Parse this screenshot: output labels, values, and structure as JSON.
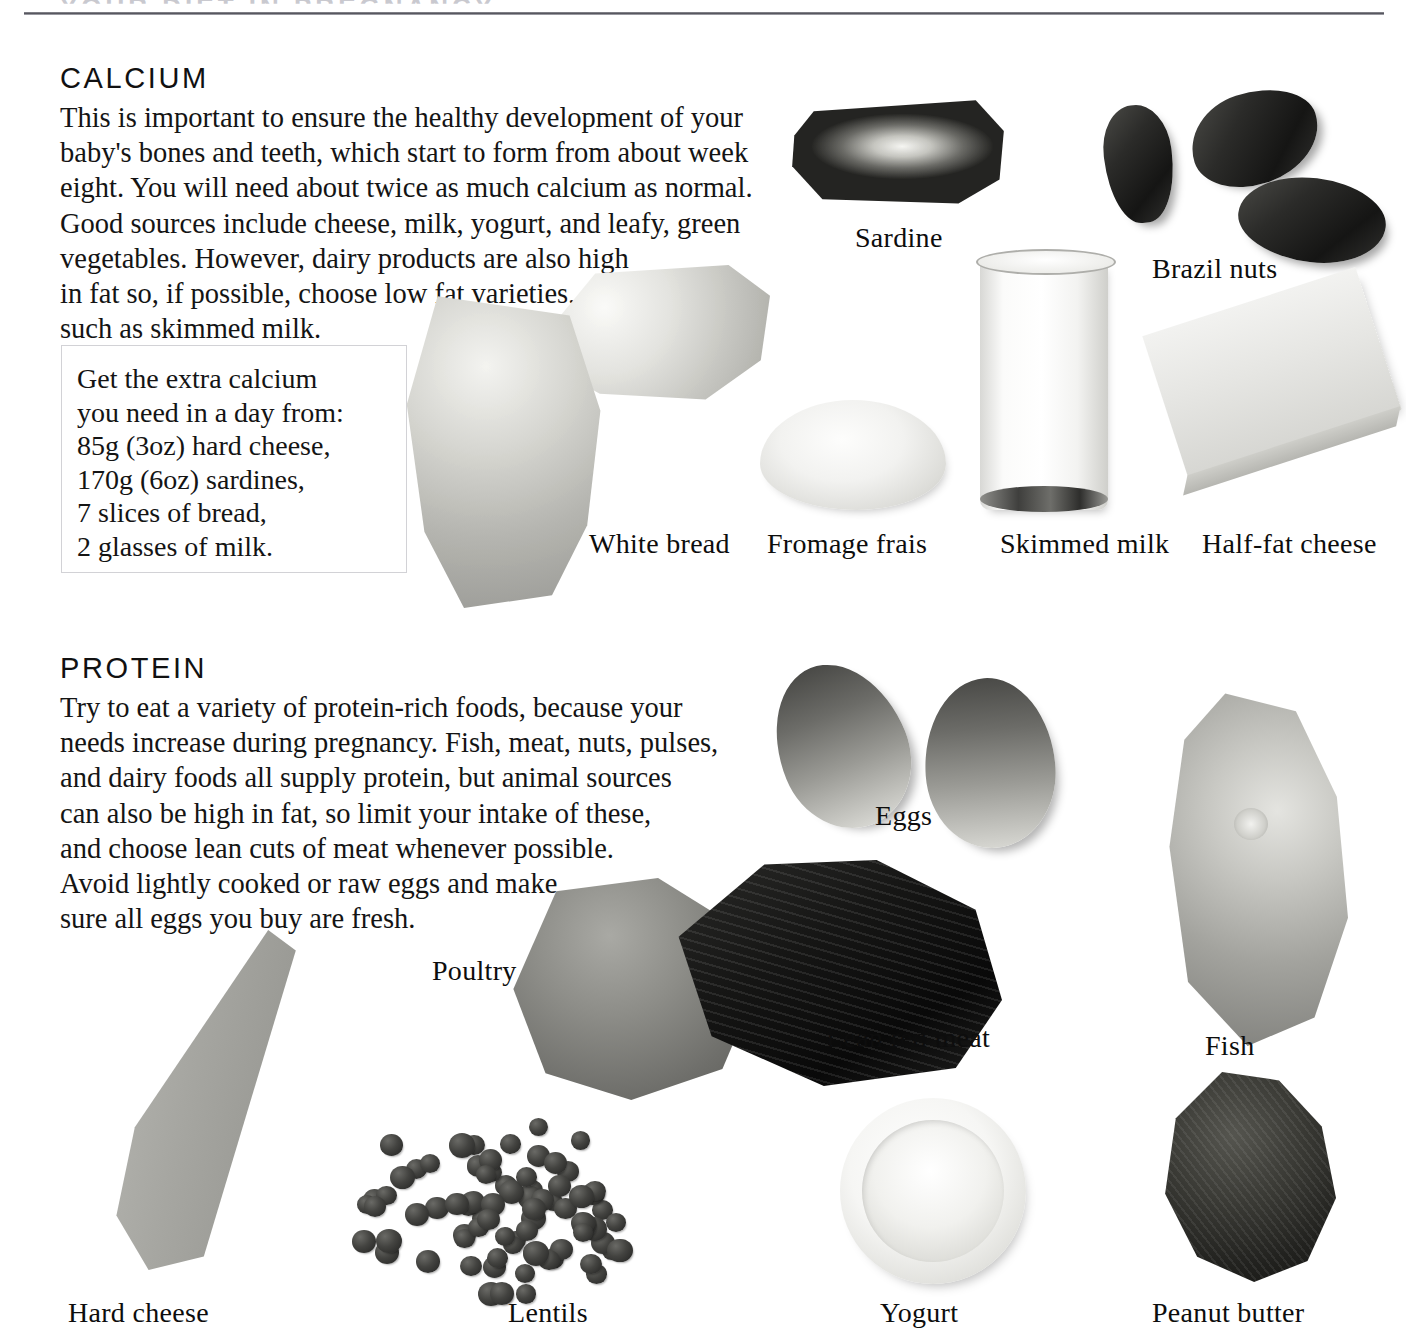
{
  "page": {
    "running_head": "YOUR DIET IN PREGNANCY",
    "background_color": "#ffffff",
    "text_color": "#111111"
  },
  "sections": [
    {
      "id": "calcium",
      "title": "CALCIUM",
      "body": "This is important to ensure the healthy development of your\nbaby's bones and teeth, which start to form from about week\neight. You will need about twice as much calcium as normal.\nGood sources include cheese, milk, yogurt, and leafy, green\nvegetables. However, dairy products are also high\nin fat so, if possible, choose low fat varieties,\nsuch as skimmed milk.",
      "callout": {
        "text": "Get the extra calcium\nyou need in a day from:\n85g (3oz) hard cheese,\n170g (6oz) sardines,\n7 slices of bread,\n2 glasses of milk.",
        "border_color": "#d2d2d6"
      },
      "foods": [
        {
          "key": "sardine",
          "caption": "Sardine"
        },
        {
          "key": "brazilnuts",
          "caption": "Brazil nuts"
        },
        {
          "key": "whitebread",
          "caption": "White bread"
        },
        {
          "key": "fromage",
          "caption": "Fromage frais"
        },
        {
          "key": "milk",
          "caption": "Skimmed milk"
        },
        {
          "key": "halffat",
          "caption": "Half-fat cheese"
        }
      ]
    },
    {
      "id": "protein",
      "title": "PROTEIN",
      "body": "Try to eat a variety of protein-rich foods, because your\nneeds increase during pregnancy. Fish, meat, nuts, pulses,\nand dairy foods all supply protein, but animal sources\ncan also be high in fat, so limit your intake of these,\nand choose lean cuts of meat whenever possible.\nAvoid lightly cooked or raw eggs and make\nsure all eggs you buy are fresh.",
      "foods": [
        {
          "key": "eggs",
          "caption": "Eggs"
        },
        {
          "key": "poultry",
          "caption": "Poultry"
        },
        {
          "key": "redmeat",
          "caption": "Lean red meat"
        },
        {
          "key": "fish",
          "caption": "Fish"
        },
        {
          "key": "hardcheese",
          "caption": "Hard cheese"
        },
        {
          "key": "lentils",
          "caption": "Lentils"
        },
        {
          "key": "yogurt",
          "caption": "Yogurt"
        },
        {
          "key": "peanutbutter",
          "caption": "Peanut butter"
        }
      ]
    }
  ]
}
